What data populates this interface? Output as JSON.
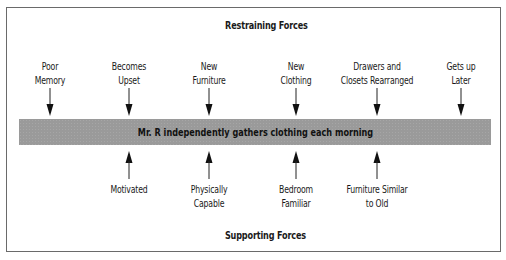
{
  "diagram": {
    "type": "force-field-analysis",
    "restraining_heading": "Restraining Forces",
    "supporting_heading": "Supporting Forces",
    "central_goal": "Mr. R independently gathers clothing each morning",
    "restraining_forces": [
      {
        "line1": "Poor",
        "line2": "Memory",
        "x": 50
      },
      {
        "line1": "Becomes",
        "line2": "Upset",
        "x": 129
      },
      {
        "line1": "New",
        "line2": "Furniture",
        "x": 209
      },
      {
        "line1": "New",
        "line2": "Clothing",
        "x": 296
      },
      {
        "line1": "Drawers and",
        "line2": "Closets Rearranged",
        "x": 377
      },
      {
        "line1": "Gets up",
        "line2": "Later",
        "x": 461
      }
    ],
    "supporting_forces": [
      {
        "line1": "Motivated",
        "line2": "",
        "x": 129
      },
      {
        "line1": "Physically",
        "line2": "Capable",
        "x": 209
      },
      {
        "line1": "Bedroom",
        "line2": "Familiar",
        "x": 296
      },
      {
        "line1": "Furniture Similar",
        "line2": "to Old",
        "x": 377
      }
    ],
    "colors": {
      "bar": "#9a9a9a",
      "border": "#6a6a6a",
      "text": "#1a1a1a"
    }
  }
}
